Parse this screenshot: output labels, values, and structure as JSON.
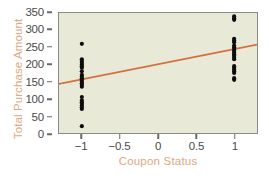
{
  "chart_data": {
    "type": "scatter",
    "title": "",
    "xlabel": "Coupon Status",
    "ylabel": "Total Purchase Amount",
    "xlim": [
      -1.3,
      1.3
    ],
    "ylim": [
      0,
      350
    ],
    "grid": false,
    "legend": null,
    "xticks": [
      -1,
      -0.5,
      0,
      0.5,
      1
    ],
    "xticklabels": [
      "−1",
      "−0.5",
      "0",
      "0.5",
      "1"
    ],
    "yticks": [
      0,
      50,
      100,
      150,
      200,
      250,
      300,
      350
    ],
    "yticklabels": [
      "0",
      "50",
      "100",
      "150",
      "200",
      "250",
      "300",
      "350"
    ],
    "series": [
      {
        "name": "Observations",
        "marker": "filled-circle",
        "color": "#0d0d0d",
        "points": [
          {
            "x": -1,
            "y": 20
          },
          {
            "x": -1,
            "y": 70
          },
          {
            "x": -1,
            "y": 75
          },
          {
            "x": -1,
            "y": 80
          },
          {
            "x": -1,
            "y": 85
          },
          {
            "x": -1,
            "y": 90
          },
          {
            "x": -1,
            "y": 95
          },
          {
            "x": -1,
            "y": 105
          },
          {
            "x": -1,
            "y": 135
          },
          {
            "x": -1,
            "y": 140
          },
          {
            "x": -1,
            "y": 145
          },
          {
            "x": -1,
            "y": 150
          },
          {
            "x": -1,
            "y": 155
          },
          {
            "x": -1,
            "y": 160
          },
          {
            "x": -1,
            "y": 165
          },
          {
            "x": -1,
            "y": 170
          },
          {
            "x": -1,
            "y": 180
          },
          {
            "x": -1,
            "y": 190
          },
          {
            "x": -1,
            "y": 195
          },
          {
            "x": -1,
            "y": 200
          },
          {
            "x": -1,
            "y": 205
          },
          {
            "x": -1,
            "y": 210
          },
          {
            "x": -1,
            "y": 215
          },
          {
            "x": -1,
            "y": 260
          },
          {
            "x": 1,
            "y": 155
          },
          {
            "x": 1,
            "y": 160
          },
          {
            "x": 1,
            "y": 175
          },
          {
            "x": 1,
            "y": 180
          },
          {
            "x": 1,
            "y": 185
          },
          {
            "x": 1,
            "y": 190
          },
          {
            "x": 1,
            "y": 195
          },
          {
            "x": 1,
            "y": 215
          },
          {
            "x": 1,
            "y": 220
          },
          {
            "x": 1,
            "y": 225
          },
          {
            "x": 1,
            "y": 230
          },
          {
            "x": 1,
            "y": 235
          },
          {
            "x": 1,
            "y": 240
          },
          {
            "x": 1,
            "y": 245
          },
          {
            "x": 1,
            "y": 250
          },
          {
            "x": 1,
            "y": 255
          },
          {
            "x": 1,
            "y": 265
          },
          {
            "x": 1,
            "y": 270
          },
          {
            "x": 1,
            "y": 275
          },
          {
            "x": 1,
            "y": 330
          },
          {
            "x": 1,
            "y": 335
          },
          {
            "x": 1,
            "y": 340
          }
        ]
      }
    ],
    "trendline": {
      "name": "Regression line",
      "color": "#d4703f",
      "x_start": -1.3,
      "y_start": 143,
      "x_end": 1.3,
      "y_end": 258
    },
    "colors": {
      "plot_background": "#e9e9d8",
      "frame": "#8a8a85",
      "tick_label": "#4a4a48",
      "axis_title": "#dba97e",
      "point": "#0d0d0d",
      "trendline": "#d4703f",
      "figure_background": "#ffffff"
    }
  }
}
